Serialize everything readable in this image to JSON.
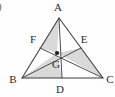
{
  "figure": {
    "part_label": ")",
    "shading_color": "#d9d9d9",
    "line_color": "#3a3a3a",
    "label_color": "#2b2b2b",
    "background_color": "#fefefe"
  },
  "vertices": {
    "A": {
      "label": "A",
      "x": 59,
      "y": 18,
      "label_x": 58,
      "label_y": 11
    },
    "B": {
      "label": "B",
      "x": 22,
      "y": 78,
      "label_x": 13,
      "label_y": 83
    },
    "C": {
      "label": "C",
      "x": 103,
      "y": 78,
      "label_x": 110,
      "label_y": 83
    }
  },
  "midpoints": {
    "D": {
      "label": "D",
      "x": 62,
      "y": 78,
      "label_x": 60,
      "label_y": 93
    },
    "E": {
      "label": "E",
      "x": 81,
      "y": 48,
      "label_x": 84,
      "label_y": 43
    },
    "F": {
      "label": "F",
      "x": 40,
      "y": 48,
      "label_x": 33,
      "label_y": 43
    }
  },
  "centroid": {
    "label": "G",
    "x": 57,
    "y": 53,
    "label_x": 56,
    "label_y": 68,
    "dot_radius": 2.1
  },
  "medians": [
    {
      "name": "median-A-D",
      "from": "A",
      "to": "D"
    },
    {
      "name": "median-B-E",
      "from": "B",
      "to": "E"
    },
    {
      "name": "median-C-F",
      "from": "C",
      "to": "F"
    }
  ],
  "sides": [
    {
      "name": "side-AB",
      "from": "A",
      "to": "B"
    },
    {
      "name": "side-BC",
      "from": "B",
      "to": "C"
    },
    {
      "name": "side-CA",
      "from": "C",
      "to": "A"
    }
  ],
  "shaded_regions": [
    {
      "name": "region-A-F-G",
      "points": "59,18 40,48 57,53"
    },
    {
      "name": "region-G-E-C",
      "points": "57,53 81,48 103,78"
    },
    {
      "name": "region-B-G-D",
      "points": "22,78 57,53 62,78"
    }
  ]
}
